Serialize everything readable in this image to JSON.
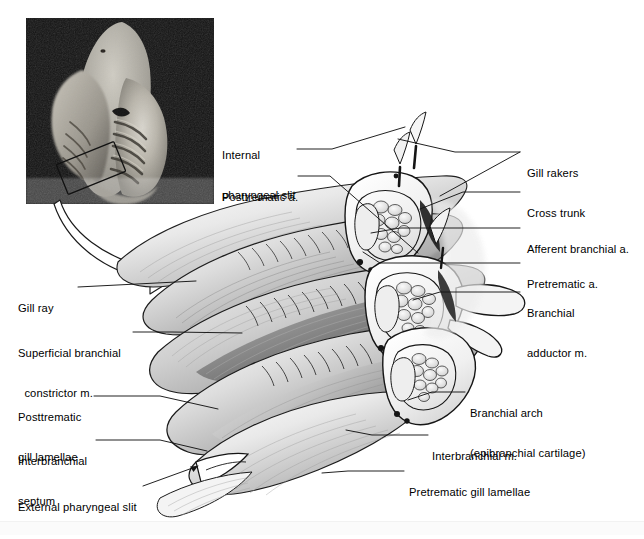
{
  "figure": {
    "background_color": "#ffffff",
    "line_color": "#1a1a1a",
    "text_color": "#000000",
    "width": 644,
    "height": 534
  },
  "photo_inset": {
    "name": "dissected-shark-head-photograph",
    "description": "black-and-white photograph of a dissected shark head, ventral view, showing pharynx and gill slits",
    "highlight_box": "rotated rectangle outlining the branchial region enlarged in the drawing",
    "frame_color": "#1b1b1b"
  },
  "transition_arrow": {
    "name": "magnification-arrow",
    "description": "hollow curved arrow leading from the boxed region of the photograph to the enlarged drawing"
  },
  "labels_left": [
    {
      "id": "gill-ray",
      "lines": [
        "Gill ray"
      ],
      "x": 18,
      "y": 281,
      "leader": [
        [
          78,
          287
        ],
        [
          196,
          281
        ]
      ]
    },
    {
      "id": "superficial-branchial-constrictor",
      "lines": [
        "Superficial branchial",
        "  constrictor m."
      ],
      "x": 18,
      "y": 326,
      "leader": [
        [
          133,
          332
        ],
        [
          172,
          332
        ],
        [
          242,
          333
        ]
      ]
    },
    {
      "id": "posttrematic-gill-lamellae",
      "lines": [
        "Posttrematic",
        "gill lamellae"
      ],
      "x": 18,
      "y": 390,
      "leader": [
        [
          94,
          396
        ],
        [
          160,
          396
        ],
        [
          218,
          409
        ]
      ]
    },
    {
      "id": "interbranchial-septum",
      "lines": [
        "Interbranchial",
        "septum"
      ],
      "x": 18,
      "y": 434,
      "leader": [
        [
          96,
          440
        ],
        [
          160,
          440
        ],
        [
          207,
          451
        ]
      ]
    },
    {
      "id": "external-pharyngeal-slit",
      "lines": [
        "External pharyngeal slit"
      ],
      "x": 18,
      "y": 480,
      "leader": [
        [
          143,
          486
        ],
        [
          198,
          466
        ]
      ],
      "arrow": true
    }
  ],
  "labels_center": [
    {
      "id": "internal-pharyngeal-slit",
      "lines": [
        "Internal",
        "pharyngeal slit"
      ],
      "x": 222,
      "y": 128,
      "leader": [
        [
          297,
          149
        ],
        [
          332,
          149
        ],
        [
          405,
          127
        ]
      ]
    },
    {
      "id": "posttrematic-a",
      "lines": [
        "Posttrematic a."
      ],
      "x": 222,
      "y": 170,
      "leader": [
        [
          298,
          176
        ],
        [
          330,
          176
        ],
        [
          418,
          253
        ]
      ]
    }
  ],
  "labels_right": [
    {
      "id": "gill-rakers",
      "lines": [
        "Gill rakers"
      ],
      "x": 527,
      "y": 146,
      "leader": [
        [
          520,
          152
        ],
        [
          455,
          152
        ],
        [
          398,
          139
        ]
      ],
      "leader2": [
        [
          520,
          152
        ],
        [
          440,
          196
        ]
      ]
    },
    {
      "id": "cross-trunk",
      "lines": [
        "Cross trunk"
      ],
      "x": 527,
      "y": 186,
      "leader": [
        [
          520,
          192
        ],
        [
          463,
          192
        ],
        [
          420,
          209
        ]
      ]
    },
    {
      "id": "afferent-branchial-a",
      "lines": [
        "Afferent branchial a."
      ],
      "x": 527,
      "y": 222,
      "leader": [
        [
          520,
          228
        ],
        [
          400,
          228
        ],
        [
          371,
          233
        ]
      ]
    },
    {
      "id": "pretrematic-a",
      "lines": [
        "Pretrematic a."
      ],
      "x": 527,
      "y": 257,
      "leader": [
        [
          520,
          263
        ],
        [
          380,
          263
        ],
        [
          363,
          252
        ]
      ]
    },
    {
      "id": "branchial-adductor-m",
      "lines": [
        "Branchial",
        "adductor m."
      ],
      "x": 527,
      "y": 286,
      "leader": [
        [
          520,
          292
        ],
        [
          440,
          292
        ],
        [
          413,
          300
        ]
      ]
    }
  ],
  "labels_lower_right": [
    {
      "id": "branchial-arch",
      "lines": [
        "Branchial arch",
        "(epibranchial cartilage)"
      ],
      "x": 470,
      "y": 386,
      "leader": [
        [
          465,
          392
        ],
        [
          432,
          392
        ],
        [
          408,
          400
        ]
      ]
    },
    {
      "id": "interbranchial-m",
      "lines": [
        "Interbranchial m."
      ],
      "x": 432,
      "y": 429,
      "leader": [
        [
          428,
          435
        ],
        [
          372,
          435
        ],
        [
          346,
          430
        ]
      ]
    },
    {
      "id": "pretrematic-gill-lamellae",
      "lines": [
        "Pretrematic gill lamellae"
      ],
      "x": 409,
      "y": 465,
      "leader": [
        [
          404,
          471
        ],
        [
          348,
          471
        ],
        [
          322,
          473
        ]
      ]
    }
  ],
  "structures": [
    "gill ray",
    "superficial branchial constrictor m.",
    "posttrematic gill lamellae",
    "interbranchial septum",
    "external pharyngeal slit",
    "internal pharyngeal slit",
    "posttrematic a.",
    "gill rakers",
    "cross trunk",
    "afferent branchial a.",
    "pretrematic a.",
    "branchial adductor m.",
    "branchial arch (epibranchial cartilage)",
    "interbranchial m.",
    "pretrematic gill lamellae"
  ]
}
